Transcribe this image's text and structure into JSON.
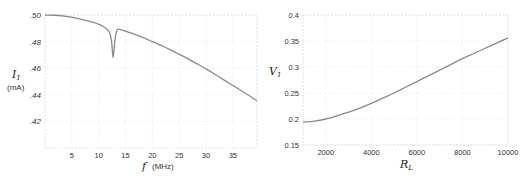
{
  "chart_data": [
    {
      "type": "line",
      "title": "",
      "xlabel": "f (MHz)",
      "ylabel": "I1 (mA)",
      "xlim": [
        0,
        39.5
      ],
      "ylim": [
        0.4,
        0.5
      ],
      "grid": true,
      "x_ticks": [
        5,
        10,
        15,
        20,
        25,
        30,
        35
      ],
      "x_tick_labels": [
        "5",
        "10",
        "15",
        "20",
        "25",
        "30",
        "35"
      ],
      "y_ticks": [
        0.5,
        0.48,
        0.46,
        0.44,
        0.42
      ],
      "y_tick_labels": [
        ".50",
        ".48",
        ".46",
        ".44",
        ".42"
      ],
      "series": [
        {
          "name": "I1",
          "color": "#8a8a8a",
          "x": [
            0,
            2,
            4,
            6,
            8,
            10,
            11,
            12,
            12.4,
            12.7,
            13.0,
            13.4,
            14,
            16,
            18,
            20,
            22,
            24,
            26,
            28,
            30,
            32,
            34,
            36,
            38,
            39.5
          ],
          "y": [
            0.5,
            0.4998,
            0.499,
            0.4975,
            0.4955,
            0.493,
            0.491,
            0.487,
            0.48,
            0.468,
            0.48,
            0.4885,
            0.489,
            0.4865,
            0.4835,
            0.48,
            0.4765,
            0.4725,
            0.4685,
            0.464,
            0.4595,
            0.4545,
            0.4495,
            0.4445,
            0.4395,
            0.4355
          ]
        }
      ]
    },
    {
      "type": "line",
      "title": "",
      "xlabel": "R_L",
      "ylabel": "V1",
      "xlim": [
        1000,
        10000
      ],
      "ylim": [
        0.15,
        0.4
      ],
      "grid": true,
      "x_ticks": [
        2000,
        4000,
        6000,
        8000,
        10000
      ],
      "x_tick_labels": [
        "2000",
        "4000",
        "6000",
        "8000",
        "10000"
      ],
      "y_ticks": [
        0.4,
        0.35,
        0.3,
        0.25,
        0.2,
        0.15
      ],
      "y_tick_labels": [
        "0.4",
        "0.35",
        "0.3",
        "0.25",
        "0.2",
        "0.15"
      ],
      "series": [
        {
          "name": "V1",
          "color": "#8a8a8a",
          "x": [
            1000,
            1500,
            2000,
            2500,
            3000,
            3500,
            4000,
            4500,
            5000,
            5500,
            6000,
            6500,
            7000,
            7500,
            8000,
            8500,
            9000,
            9500,
            10000
          ],
          "y": [
            0.194,
            0.196,
            0.2,
            0.206,
            0.213,
            0.221,
            0.23,
            0.24,
            0.25,
            0.261,
            0.272,
            0.283,
            0.294,
            0.305,
            0.316,
            0.326,
            0.336,
            0.346,
            0.356
          ]
        }
      ]
    }
  ],
  "left_chart": {
    "ylabel_main": "I",
    "ylabel_sub": "1",
    "ylabel_unit": "(mA)",
    "xlabel_main": "f",
    "xlabel_unit": "(MHz)"
  },
  "right_chart": {
    "ylabel_main": "V",
    "ylabel_sub": "1",
    "xlabel_main": "R",
    "xlabel_sub": "L"
  }
}
